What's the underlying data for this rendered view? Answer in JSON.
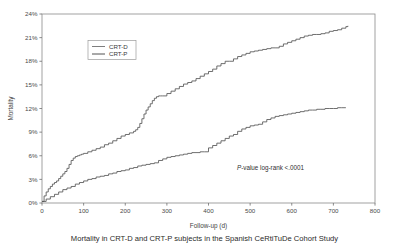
{
  "figure": {
    "background_color": "#ffffff",
    "caption": "Mortality in CRT-D and CRT-P subjects in the Spanish CeRtiTuDe Cohort Study"
  },
  "chart_data": {
    "type": "line",
    "title": "",
    "subtitle": "",
    "xlabel": "Follow-up (d)",
    "ylabel": "Mortality",
    "xlim": [
      0,
      800
    ],
    "ylim": [
      0,
      24
    ],
    "xticks": [
      0,
      100,
      200,
      300,
      400,
      500,
      600,
      700,
      800
    ],
    "xtick_labels": [
      "0",
      "100",
      "200",
      "300",
      "400",
      "500",
      "600",
      "700",
      "800"
    ],
    "yticks": [
      0,
      3,
      6,
      9,
      12,
      15,
      18,
      21,
      24
    ],
    "ytick_labels": [
      "0%",
      "3%",
      "6%",
      "9%",
      "12%",
      "15%",
      "18%",
      "21%",
      "24%"
    ],
    "grid": false,
    "legend_position": "upper-left-inset",
    "annotations": [
      {
        "name": "p-value",
        "italic_prefix": "P",
        "text": "-value log-rank  <.0001",
        "full_text": "P-value log-rank  <.0001",
        "x": 430,
        "y": 4.1
      }
    ],
    "series": [
      {
        "name": "CRT-D",
        "color": "#555555",
        "x": [
          0,
          5,
          10,
          15,
          20,
          25,
          30,
          35,
          40,
          45,
          50,
          55,
          60,
          65,
          70,
          75,
          80,
          85,
          90,
          95,
          100,
          110,
          120,
          130,
          140,
          150,
          160,
          170,
          180,
          190,
          200,
          210,
          220,
          225,
          230,
          235,
          240,
          245,
          250,
          255,
          260,
          265,
          270,
          275,
          280,
          285,
          290,
          300,
          310,
          320,
          330,
          340,
          350,
          360,
          370,
          380,
          390,
          400,
          410,
          420,
          430,
          440,
          450,
          460,
          470,
          480,
          490,
          500,
          510,
          520,
          530,
          540,
          550,
          560,
          570,
          580,
          590,
          600,
          610,
          620,
          630,
          640,
          650,
          660,
          670,
          680,
          690,
          700,
          710,
          720,
          730,
          735
        ],
        "values": [
          0.2,
          0.9,
          1.4,
          1.8,
          2.1,
          2.4,
          2.6,
          2.8,
          3.1,
          3.4,
          3.7,
          4.0,
          4.4,
          4.9,
          5.4,
          5.7,
          5.9,
          6.0,
          6.1,
          6.2,
          6.3,
          6.5,
          6.7,
          6.9,
          7.1,
          7.4,
          7.6,
          7.9,
          8.2,
          8.5,
          8.7,
          8.9,
          9.1,
          9.3,
          9.6,
          10.1,
          10.7,
          11.3,
          11.8,
          12.2,
          12.6,
          13.0,
          13.3,
          13.5,
          13.6,
          13.6,
          13.6,
          13.9,
          14.2,
          14.5,
          14.8,
          15.1,
          15.3,
          15.5,
          15.8,
          16.1,
          16.4,
          16.7,
          17.0,
          17.4,
          17.7,
          18.0,
          18.0,
          18.3,
          18.6,
          18.8,
          19.0,
          19.2,
          19.3,
          19.4,
          19.5,
          19.6,
          19.7,
          19.7,
          19.9,
          20.2,
          20.4,
          20.6,
          20.8,
          21.0,
          21.2,
          21.3,
          21.4,
          21.4,
          21.5,
          21.6,
          21.8,
          21.9,
          22.0,
          22.2,
          22.4,
          22.5
        ]
      },
      {
        "name": "CRT-P",
        "color": "#555555",
        "x": [
          0,
          10,
          20,
          30,
          40,
          50,
          60,
          70,
          80,
          90,
          100,
          110,
          120,
          130,
          140,
          150,
          160,
          170,
          180,
          190,
          200,
          210,
          220,
          230,
          240,
          250,
          260,
          270,
          280,
          290,
          300,
          310,
          320,
          330,
          340,
          350,
          360,
          370,
          380,
          390,
          400,
          410,
          420,
          430,
          440,
          450,
          460,
          470,
          480,
          490,
          500,
          510,
          520,
          530,
          540,
          550,
          560,
          570,
          580,
          590,
          600,
          610,
          620,
          630,
          640,
          650,
          660,
          670,
          680,
          690,
          700,
          710,
          720,
          730
        ],
        "values": [
          0.2,
          0.5,
          0.8,
          1.1,
          1.4,
          1.7,
          1.9,
          2.1,
          2.4,
          2.6,
          2.8,
          3.0,
          3.1,
          3.3,
          3.4,
          3.5,
          3.7,
          3.8,
          4.0,
          4.1,
          4.2,
          4.4,
          4.5,
          4.7,
          4.8,
          4.9,
          5.0,
          5.1,
          5.4,
          5.6,
          5.8,
          5.9,
          6.0,
          6.1,
          6.2,
          6.3,
          6.4,
          6.4,
          6.5,
          6.5,
          7.0,
          7.3,
          7.6,
          7.9,
          8.2,
          8.5,
          8.7,
          9.1,
          9.4,
          9.6,
          9.8,
          9.9,
          10.0,
          10.3,
          10.6,
          10.8,
          11.0,
          11.1,
          11.2,
          11.3,
          11.4,
          11.5,
          11.6,
          11.7,
          11.8,
          11.8,
          11.9,
          11.9,
          12.0,
          12.0,
          12.0,
          12.1,
          12.1,
          12.1
        ]
      }
    ],
    "legend": [
      {
        "label": "CRT-D",
        "color": "#6f6f6f"
      },
      {
        "label": "CRT-P",
        "color": "#3f3f3f"
      }
    ]
  }
}
